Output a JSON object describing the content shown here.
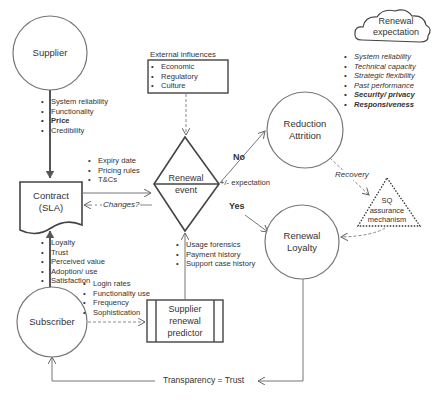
{
  "nodes": {
    "supplier": "Supplier",
    "contract": {
      "line1": "Contract",
      "line2": "(SLA)"
    },
    "renewal_event": {
      "line1": "Renewal",
      "line2": "event"
    },
    "reduction_attrition": {
      "line1": "Reduction",
      "line2": "Attrition"
    },
    "renewal_loyalty": {
      "line1": "Renewal",
      "line2": "Loyalty"
    },
    "subscriber": "Subscriber",
    "supplier_predictor": {
      "line1": "Supplier",
      "line2": "renewal",
      "line3": "predictor"
    },
    "sq_mechanism": {
      "line1": "SQ",
      "line2": "assurance",
      "line3": "mechanism"
    },
    "renewal_expectation": {
      "line1": "Renewal",
      "line2": "expectation"
    }
  },
  "lists": {
    "supplier_attributes": [
      "System reliability",
      "Functionality",
      "Price",
      "Credibility"
    ],
    "external_influences": {
      "title": "External influences",
      "items": [
        "Economic",
        "Regulatory",
        "Culture"
      ]
    },
    "contract_terms": [
      "Expiry date",
      "Pricing rules",
      "T&Cs"
    ],
    "subscriber_outcomes": [
      "Loyalty",
      "Trust",
      "Perceived value",
      "Adoption/ use",
      "Satisfaction"
    ],
    "usage_signals": [
      "Login rates",
      "Functionality use",
      "Frequency",
      "Sophistication"
    ],
    "predictor_inputs": [
      "Usage forensics",
      "Payment history",
      "Support case history"
    ],
    "renewal_expectation_items": [
      "System reliability",
      "Technical capacity",
      "Strategic flexibility",
      "Past performance",
      "Security/ privacy",
      "Responsiveness"
    ]
  },
  "edge_labels": {
    "changes": "Changes?",
    "no": "No",
    "yes": "Yes",
    "expectation": "+/- expectation",
    "recovery": "Recovery",
    "transparency": "Transparency = Trust"
  },
  "colors": {
    "stroke": "#555555",
    "text": "#333333",
    "dashed": "#888888"
  }
}
